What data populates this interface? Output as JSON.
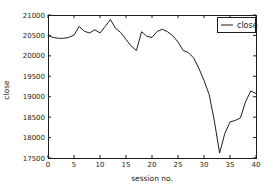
{
  "figure": {
    "background": "#ffffff",
    "axes_color": "#1d1d1d"
  },
  "chart_data": {
    "type": "line",
    "title": "",
    "xlabel": "session no.",
    "ylabel": "close",
    "legend_label": "close",
    "legend_position": "upper right",
    "grid": false,
    "xlim": [
      0,
      40
    ],
    "ylim": [
      17500,
      21000
    ],
    "x_ticks": [
      0,
      5,
      10,
      15,
      20,
      25,
      30,
      35,
      40
    ],
    "y_ticks": [
      17500,
      18000,
      18500,
      19000,
      19500,
      20000,
      20500,
      21000
    ],
    "series": [
      {
        "name": "close",
        "color": "#1d1d1d",
        "x": [
          0,
          1,
          2,
          3,
          4,
          5,
          6,
          7,
          8,
          9,
          10,
          11,
          12,
          13,
          14,
          15,
          16,
          17,
          18,
          19,
          20,
          21,
          22,
          23,
          24,
          25,
          26,
          27,
          28,
          29,
          30,
          31,
          32,
          33,
          34,
          35,
          36,
          37,
          38,
          39,
          40
        ],
        "values": [
          20500,
          20450,
          20430,
          20430,
          20450,
          20510,
          20720,
          20600,
          20560,
          20640,
          20560,
          20720,
          20890,
          20670,
          20570,
          20400,
          20240,
          20130,
          20590,
          20480,
          20450,
          20600,
          20650,
          20590,
          20490,
          20340,
          20130,
          20080,
          19950,
          19700,
          19400,
          19050,
          18400,
          17620,
          18100,
          18380,
          18420,
          18480,
          18880,
          19140,
          19080
        ]
      }
    ]
  }
}
